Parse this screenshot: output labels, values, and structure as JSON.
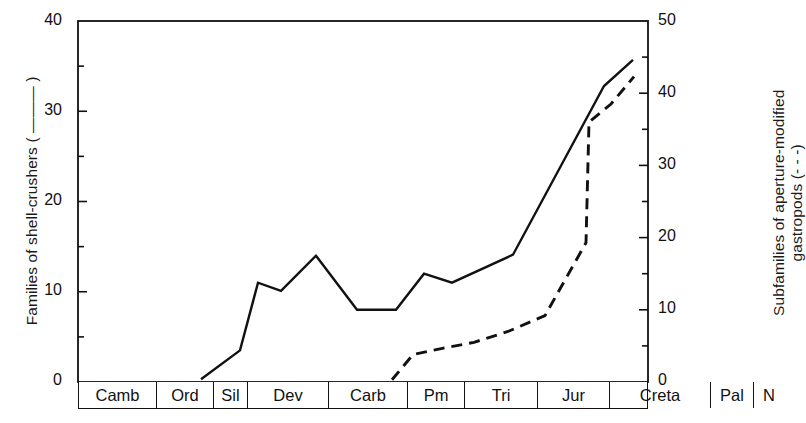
{
  "chart_data": {
    "type": "line",
    "title": "",
    "xlabel": "",
    "ylabel": "Families of shell-crushers ( ——— )",
    "y2label_line1": "Subfamilies of aperture-modified",
    "y2label_line2": "gastropods (- - -)",
    "ylim": [
      0,
      40
    ],
    "y2lim": [
      0,
      50
    ],
    "yticks": [
      "0",
      "10",
      "20",
      "30",
      "40"
    ],
    "ytick_values": [
      0,
      10,
      20,
      30,
      40
    ],
    "y2ticks": [
      "0",
      "10",
      "20",
      "30",
      "40",
      "50"
    ],
    "y2tick_values": [
      0,
      10,
      20,
      30,
      40,
      50
    ],
    "y_minor_values": [
      5,
      15,
      25,
      35
    ],
    "y2_minor_values": [
      5,
      15,
      25,
      35,
      45
    ],
    "grid": false,
    "legend_position": "in-axis-labels",
    "categories": [
      "Camb",
      "Ord",
      "Sil",
      "Dev",
      "Carb",
      "Pm",
      "Tri",
      "Jur",
      "Creta",
      "Pal",
      "N"
    ],
    "category_widths": [
      78,
      57,
      34,
      81,
      79,
      57,
      73,
      72,
      101,
      43,
      30
    ],
    "series": [
      {
        "name": "Families of shell-crushers",
        "style": "solid",
        "axis": "left",
        "color": "#111111",
        "points": [
          {
            "period": "Sil",
            "x": 201,
            "value": 0.3
          },
          {
            "period": "Sil/Dev",
            "x": 240,
            "value": 3.5
          },
          {
            "period": "Dev",
            "x": 258,
            "value": 11.0
          },
          {
            "period": "Dev/Carb",
            "x": 281,
            "value": 10.1
          },
          {
            "period": "Carb",
            "x": 316,
            "value": 14.0
          },
          {
            "period": "Carb/Pm",
            "x": 357,
            "value": 8.0
          },
          {
            "period": "Pm",
            "x": 396,
            "value": 8.0
          },
          {
            "period": "Tri",
            "x": 424,
            "value": 12.0
          },
          {
            "period": "Tri/Jur",
            "x": 452,
            "value": 11.0
          },
          {
            "period": "Jur",
            "x": 513,
            "value": 14.1
          },
          {
            "period": "Creta",
            "x": 604,
            "value": 32.8
          },
          {
            "period": "Pal/N",
            "x": 633,
            "value": 35.7
          }
        ]
      },
      {
        "name": "Subfamilies of aperture-modified gastropods",
        "style": "dashed",
        "axis": "right",
        "color": "#111111",
        "points": [
          {
            "period": "Tri",
            "x": 392,
            "value": 0.3
          },
          {
            "period": "Tri",
            "x": 413,
            "value": 3.8
          },
          {
            "period": "Tri/Jur",
            "x": 440,
            "value": 4.6
          },
          {
            "period": "Jur",
            "x": 474,
            "value": 5.5
          },
          {
            "period": "Jur/Creta",
            "x": 508,
            "value": 7.0
          },
          {
            "period": "Creta",
            "x": 545,
            "value": 9.2
          },
          {
            "period": "Creta",
            "x": 586,
            "value": 19.3
          },
          {
            "period": "Creta/Pal",
            "x": 589,
            "value": 36.0
          },
          {
            "period": "Pal",
            "x": 611,
            "value": 38.5
          },
          {
            "period": "N",
            "x": 634,
            "value": 42.3
          }
        ]
      }
    ]
  },
  "axes": {
    "frame_color": "#111111",
    "left_tick_labels": [
      "40",
      "30",
      "20",
      "10",
      "0"
    ],
    "right_tick_labels": [
      "50",
      "40",
      "30",
      "20",
      "10",
      "0"
    ]
  }
}
